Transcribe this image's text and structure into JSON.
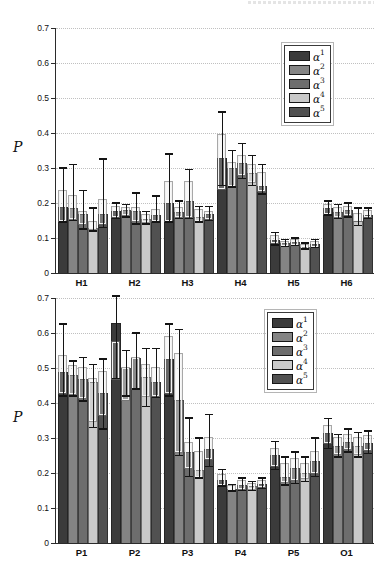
{
  "chart_data": [
    {
      "type": "bar",
      "panel": "top",
      "title": "",
      "ylabel": "P",
      "xlabel": "",
      "ylim": [
        0,
        0.7
      ],
      "yticks": [
        "0",
        "0.1",
        "0.2",
        "0.3",
        "0.4",
        "0.5",
        "0.6",
        "0.7"
      ],
      "grid": "dotted-horizontal",
      "categories": [
        "H1",
        "H2",
        "H3",
        "H4",
        "H5",
        "H6"
      ],
      "legend_position": "upper-right-inside",
      "series": [
        {
          "name": "α^1",
          "color": "#3b3b3b",
          "values": [
            0.19,
            0.178,
            0.2,
            0.33,
            0.095,
            0.185
          ],
          "whisker_low": [
            0.145,
            0.155,
            0.145,
            0.25,
            0.08,
            0.165
          ],
          "whisker_high": [
            0.3,
            0.2,
            0.34,
            0.46,
            0.115,
            0.205
          ],
          "box_low": [
            0.15,
            0.16,
            0.15,
            0.24,
            0.085,
            0.17
          ],
          "box_high": [
            0.235,
            0.19,
            0.26,
            0.395,
            0.105,
            0.195
          ]
        },
        {
          "name": "α^2",
          "color": "#848484",
          "values": [
            0.185,
            0.18,
            0.175,
            0.3,
            0.085,
            0.175
          ],
          "whisker_low": [
            0.15,
            0.16,
            0.155,
            0.245,
            0.075,
            0.155
          ],
          "whisker_high": [
            0.31,
            0.195,
            0.205,
            0.35,
            0.095,
            0.195
          ],
          "box_low": [
            0.155,
            0.165,
            0.16,
            0.25,
            0.078,
            0.16
          ],
          "box_high": [
            0.22,
            0.185,
            0.185,
            0.315,
            0.09,
            0.185
          ]
        },
        {
          "name": "α^3",
          "color": "#6d6d6d",
          "values": [
            0.17,
            0.177,
            0.205,
            0.315,
            0.088,
            0.18
          ],
          "whisker_low": [
            0.125,
            0.14,
            0.155,
            0.27,
            0.078,
            0.16
          ],
          "whisker_high": [
            0.235,
            0.228,
            0.295,
            0.37,
            0.1,
            0.2
          ],
          "box_low": [
            0.14,
            0.15,
            0.16,
            0.28,
            0.08,
            0.165
          ],
          "box_high": [
            0.175,
            0.185,
            0.26,
            0.335,
            0.095,
            0.19
          ]
        },
        {
          "name": "α^4",
          "color": "#c9c9c9",
          "values": [
            0.13,
            0.155,
            0.16,
            0.285,
            0.075,
            0.15
          ],
          "whisker_low": [
            0.12,
            0.14,
            0.145,
            0.25,
            0.068,
            0.135
          ],
          "whisker_high": [
            0.185,
            0.175,
            0.19,
            0.335,
            0.085,
            0.185
          ],
          "box_low": [
            0.125,
            0.145,
            0.15,
            0.26,
            0.07,
            0.15
          ],
          "box_high": [
            0.145,
            0.165,
            0.18,
            0.31,
            0.08,
            0.17
          ]
        },
        {
          "name": "α^5",
          "color": "#515151",
          "values": [
            0.17,
            0.165,
            0.17,
            0.25,
            0.082,
            0.165
          ],
          "whisker_low": [
            0.13,
            0.145,
            0.15,
            0.225,
            0.072,
            0.155
          ],
          "whisker_high": [
            0.325,
            0.22,
            0.19,
            0.31,
            0.095,
            0.185
          ],
          "box_low": [
            0.14,
            0.15,
            0.155,
            0.235,
            0.075,
            0.16
          ],
          "box_high": [
            0.21,
            0.18,
            0.175,
            0.285,
            0.088,
            0.178
          ]
        }
      ]
    },
    {
      "type": "bar",
      "panel": "bottom",
      "title": "",
      "ylabel": "P",
      "xlabel": "",
      "ylim": [
        0,
        0.7
      ],
      "yticks": [
        "0",
        "0.1",
        "0.2",
        "0.3",
        "0.4",
        "0.5",
        "0.6",
        "0.7"
      ],
      "grid": "dotted-horizontal",
      "categories": [
        "P1",
        "P2",
        "P3",
        "P4",
        "P5",
        "O1"
      ],
      "legend_position": "upper-right-inside",
      "series": [
        {
          "name": "α^1",
          "color": "#3b3b3b",
          "values": [
            0.49,
            0.63,
            0.525,
            0.181,
            0.252,
            0.314
          ],
          "whisker_low": [
            0.42,
            0.47,
            0.42,
            0.162,
            0.21,
            0.27
          ],
          "whisker_high": [
            0.625,
            0.705,
            0.625,
            0.21,
            0.29,
            0.355
          ],
          "box_low": [
            0.43,
            0.47,
            0.43,
            0.167,
            0.22,
            0.285
          ],
          "box_high": [
            0.535,
            0.575,
            0.59,
            0.195,
            0.27,
            0.335
          ]
        },
        {
          "name": "α^2",
          "color": "#848484",
          "values": [
            0.48,
            0.5,
            0.41,
            0.155,
            0.19,
            0.276
          ],
          "whisker_low": [
            0.42,
            0.42,
            0.25,
            0.148,
            0.165,
            0.245
          ],
          "whisker_high": [
            0.52,
            0.55,
            0.61,
            0.167,
            0.245,
            0.31
          ],
          "box_low": [
            0.425,
            0.41,
            0.26,
            0.15,
            0.175,
            0.255
          ],
          "box_high": [
            0.505,
            0.5,
            0.54,
            0.162,
            0.225,
            0.3
          ]
        },
        {
          "name": "α^3",
          "color": "#6d6d6d",
          "values": [
            0.47,
            0.53,
            0.26,
            0.167,
            0.214,
            0.29
          ],
          "whisker_low": [
            0.405,
            0.44,
            0.19,
            0.15,
            0.17,
            0.26
          ],
          "whisker_high": [
            0.53,
            0.6,
            0.356,
            0.185,
            0.26,
            0.325
          ],
          "box_low": [
            0.415,
            0.44,
            0.213,
            0.155,
            0.18,
            0.27
          ],
          "box_high": [
            0.5,
            0.53,
            0.285,
            0.176,
            0.24,
            0.31
          ]
        },
        {
          "name": "α^4",
          "color": "#c9c9c9",
          "values": [
            0.46,
            0.475,
            0.21,
            0.162,
            0.2,
            0.276
          ],
          "whisker_low": [
            0.33,
            0.39,
            0.185,
            0.15,
            0.175,
            0.245
          ],
          "whisker_high": [
            0.51,
            0.555,
            0.3,
            0.175,
            0.245,
            0.315
          ],
          "box_low": [
            0.35,
            0.42,
            0.19,
            0.155,
            0.185,
            0.255
          ],
          "box_high": [
            0.47,
            0.51,
            0.26,
            0.17,
            0.225,
            0.3
          ]
        },
        {
          "name": "α^5",
          "color": "#515151",
          "values": [
            0.43,
            0.46,
            0.27,
            0.17,
            0.235,
            0.285
          ],
          "whisker_low": [
            0.325,
            0.415,
            0.218,
            0.155,
            0.19,
            0.255
          ],
          "whisker_high": [
            0.525,
            0.555,
            0.366,
            0.185,
            0.3,
            0.32
          ],
          "box_low": [
            0.365,
            0.42,
            0.24,
            0.16,
            0.2,
            0.265
          ],
          "box_high": [
            0.49,
            0.5,
            0.3,
            0.178,
            0.26,
            0.305
          ]
        }
      ]
    }
  ]
}
